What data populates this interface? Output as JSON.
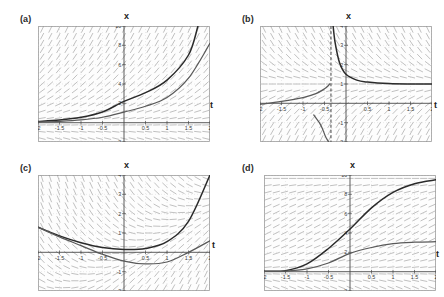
{
  "figure": {
    "layout": "2x2 grid of slope-field plots",
    "background_color": "#ffffff",
    "panels_order": [
      "a",
      "b",
      "c",
      "d"
    ]
  },
  "panels": {
    "a": {
      "label": "(a)",
      "axis_x_name": "x",
      "axis_t_name": "t"
    },
    "b": {
      "label": "(b)",
      "axis_x_name": "x",
      "axis_t_name": "t"
    },
    "c": {
      "label": "(c)",
      "axis_x_name": "x",
      "axis_t_name": "t"
    },
    "d": {
      "label": "(d)",
      "axis_x_name": "x",
      "axis_t_name": "t"
    }
  },
  "chart_data": [
    {
      "id": "a",
      "type": "line",
      "title": "(a)",
      "xlabel": "t",
      "ylabel": "x",
      "xlim": [
        -2,
        2
      ],
      "ylim": [
        -2,
        10
      ],
      "grid": true,
      "grid_style": "dotted",
      "legend": "none",
      "xticks": [
        -2,
        -1.5,
        -1,
        -0.5,
        0.5,
        1,
        1.5,
        2
      ],
      "xticklabels": [
        "-2",
        "-1.5",
        "-1",
        "-0.5",
        "0.5",
        "1",
        "1.5",
        "2"
      ],
      "yticks": [
        -2,
        2,
        4,
        6,
        8,
        10
      ],
      "yticklabels": [
        "-2",
        "2",
        "4",
        "6",
        "8",
        "10"
      ],
      "direction_field": "exponential growth slopes proportional to x",
      "series": [
        {
          "name": "upper exponential solution",
          "color": "#595959",
          "x": [
            -2,
            -1.5,
            -1,
            -0.5,
            0,
            0.5,
            1,
            1.5,
            1.72
          ],
          "values": [
            0.13,
            0.27,
            0.55,
            1.1,
            2.2,
            3.1,
            4.4,
            7.0,
            10.0
          ]
        },
        {
          "name": "lower exponential solution",
          "color": "#2a2a2a",
          "x": [
            -2,
            -1.5,
            -1,
            -0.5,
            0,
            0.5,
            1,
            1.5,
            2
          ],
          "values": [
            0.07,
            0.14,
            0.28,
            0.56,
            1.1,
            1.7,
            2.6,
            4.6,
            8.2
          ]
        }
      ]
    },
    {
      "id": "b",
      "type": "line",
      "title": "(b)",
      "xlabel": "t",
      "ylabel": "x",
      "xlim": [
        -2,
        2
      ],
      "ylim": [
        -2,
        4
      ],
      "grid": true,
      "grid_style": "dotted",
      "legend": "none",
      "xticks": [
        -2,
        -1.5,
        -1,
        -0.5,
        0.5,
        1,
        1.5,
        2
      ],
      "xticklabels": [
        "-2",
        "-1.5",
        "-1",
        "-0.5",
        "0.5",
        "1",
        "1.5",
        "2"
      ],
      "yticks": [
        -2,
        -1,
        1,
        2,
        3,
        4
      ],
      "yticklabels": [
        "-2",
        "-1",
        "1",
        "2",
        "3",
        "4"
      ],
      "asymptote_t": -0.35,
      "asymptote_style": "dashed vertical",
      "direction_field": "slopes converging to x = 1 on the right branch",
      "series": [
        {
          "name": "hyperbolic branch (right of asymptote)",
          "color": "#2a2a2a",
          "x": [
            -0.3,
            -0.25,
            -0.15,
            0,
            0.25,
            0.5,
            1,
            1.5,
            2
          ],
          "values": [
            4.0,
            3.1,
            2.1,
            1.5,
            1.2,
            1.1,
            1.02,
            1.0,
            1.0
          ]
        },
        {
          "name": "hyperbolic branch (left of asymptote)",
          "color": "#2a2a2a",
          "x": [
            -2,
            -1.5,
            -1,
            -0.7,
            -0.5,
            -0.42,
            -0.38
          ],
          "values": [
            -0.05,
            0.1,
            0.3,
            0.5,
            0.75,
            0.9,
            1.0
          ]
        },
        {
          "name": "lower hyperbolic branch",
          "color": "#595959",
          "x": [
            -0.75,
            -0.7,
            -0.62,
            -0.55,
            -0.48,
            -0.43,
            -0.4
          ],
          "values": [
            -0.6,
            -0.75,
            -1.0,
            -1.3,
            -1.7,
            -1.9,
            -2.0
          ]
        }
      ]
    },
    {
      "id": "c",
      "type": "line",
      "title": "(c)",
      "xlabel": "t",
      "ylabel": "x",
      "xlim": [
        -2,
        2
      ],
      "ylim": [
        -2,
        4
      ],
      "grid": true,
      "grid_style": "dotted",
      "legend": "none",
      "xticks": [
        -2,
        -1.5,
        -1,
        -0.5,
        0.5,
        1,
        1.5,
        2
      ],
      "xticklabels": [
        "-2",
        "-1.5",
        "-1",
        "-0.5",
        "0.5",
        "1",
        "1.5",
        "2"
      ],
      "yticks": [
        -2,
        -1,
        1,
        2,
        3,
        4
      ],
      "yticklabels": [
        "-2",
        "-1",
        "1",
        "2",
        "3",
        "4"
      ],
      "direction_field": "saddle-like slopes, steep diagonals upper-left and lower-right",
      "series": [
        {
          "name": "upper U-shaped solution",
          "color": "#2a2a2a",
          "x": [
            -2,
            -1.5,
            -1,
            -0.5,
            0,
            0.5,
            1,
            1.5,
            2
          ],
          "values": [
            1.3,
            0.85,
            0.5,
            0.25,
            0.15,
            0.2,
            0.55,
            1.6,
            4.0
          ]
        },
        {
          "name": "lower U-shaped solution",
          "color": "#595959",
          "x": [
            -2,
            -1.5,
            -1,
            -0.5,
            0,
            0.5,
            1,
            1.5,
            2
          ],
          "values": [
            1.3,
            0.8,
            0.35,
            -0.1,
            -0.45,
            -0.6,
            -0.5,
            0.0,
            0.6
          ]
        }
      ]
    },
    {
      "id": "d",
      "type": "line",
      "title": "(d)",
      "xlabel": "t",
      "ylabel": "x",
      "xlim": [
        -2,
        2
      ],
      "ylim": [
        -2,
        10
      ],
      "grid": true,
      "grid_style": "dotted",
      "legend": "none",
      "xticks": [
        -2,
        -1.5,
        -1,
        -0.5,
        0.5,
        1,
        1.5,
        2
      ],
      "xticklabels": [
        "-2",
        "-1.5",
        "-1",
        "-0.5",
        "0.5",
        "1",
        "1.5",
        "2"
      ],
      "yticks": [
        -2,
        2,
        4,
        6,
        8,
        10
      ],
      "yticklabels": [
        "-2",
        "2",
        "4",
        "6",
        "8",
        "10"
      ],
      "direction_field": "logistic slopes, horizontal near x = 0 and near saturation",
      "series": [
        {
          "name": "upper logistic solution",
          "color": "#595959",
          "x": [
            -2,
            -1.5,
            -1,
            -0.5,
            0,
            0.5,
            1,
            1.5,
            2
          ],
          "values": [
            0.05,
            0.1,
            0.8,
            2.4,
            4.4,
            6.6,
            8.2,
            9.1,
            9.5
          ]
        },
        {
          "name": "lower logistic solution",
          "color": "#2a2a2a",
          "x": [
            -2,
            -1.5,
            -1,
            -0.5,
            0,
            0.5,
            1,
            1.5,
            2
          ],
          "values": [
            0.03,
            0.06,
            0.3,
            0.9,
            1.9,
            2.5,
            2.9,
            3.05,
            3.1
          ]
        }
      ]
    }
  ]
}
